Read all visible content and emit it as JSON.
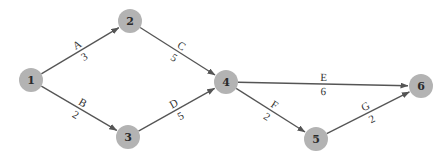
{
  "diagram": {
    "type": "activity-on-arc network",
    "nodes": [
      {
        "id": "1",
        "label": "1",
        "x": 31,
        "y": 80
      },
      {
        "id": "2",
        "label": "2",
        "x": 130,
        "y": 21
      },
      {
        "id": "3",
        "label": "3",
        "x": 128,
        "y": 137
      },
      {
        "id": "4",
        "label": "4",
        "x": 226,
        "y": 82
      },
      {
        "id": "5",
        "label": "5",
        "x": 316,
        "y": 139
      },
      {
        "id": "6",
        "label": "6",
        "x": 421,
        "y": 86
      }
    ],
    "edges": [
      {
        "from": "1",
        "to": "2",
        "activity": "A",
        "duration": "3"
      },
      {
        "from": "1",
        "to": "3",
        "activity": "B",
        "duration": "2"
      },
      {
        "from": "2",
        "to": "4",
        "activity": "C",
        "duration": "5"
      },
      {
        "from": "3",
        "to": "4",
        "activity": "D",
        "duration": "5"
      },
      {
        "from": "4",
        "to": "6",
        "activity": "E",
        "duration": "6"
      },
      {
        "from": "4",
        "to": "5",
        "activity": "F",
        "duration": "2"
      },
      {
        "from": "5",
        "to": "6",
        "activity": "G",
        "duration": "2"
      }
    ]
  },
  "style": {
    "node_fill": "#b3b3b3",
    "edge_color": "#555555",
    "node_radius": 12
  }
}
